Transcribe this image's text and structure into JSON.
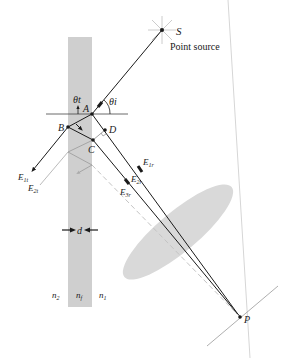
{
  "diagram": {
    "source": {
      "label": "S",
      "caption": "Point source"
    },
    "points": {
      "A": "A",
      "B": "B",
      "C": "C",
      "D": "D",
      "P": "P"
    },
    "angles": {
      "transmitted": "θt",
      "incident": "θi"
    },
    "rays": {
      "E1t": {
        "main": "E",
        "sub": "1t"
      },
      "E2t": {
        "main": "E",
        "sub": "2t"
      },
      "E1r": {
        "main": "E",
        "sub": "1r"
      },
      "E2r": {
        "main": "E",
        "sub": "2r"
      },
      "E3r": {
        "main": "E",
        "sub": "3r"
      }
    },
    "thickness": "d",
    "indices": {
      "n2": {
        "main": "n",
        "sub": "2"
      },
      "nf": {
        "main": "n",
        "sub": "f"
      },
      "n1": {
        "main": "n",
        "sub": "1"
      }
    },
    "colors": {
      "film": "#cfcfcf",
      "lens": "#d9d9d9",
      "ray": "#1a1a1a",
      "faint": "#b8b8b8"
    }
  }
}
